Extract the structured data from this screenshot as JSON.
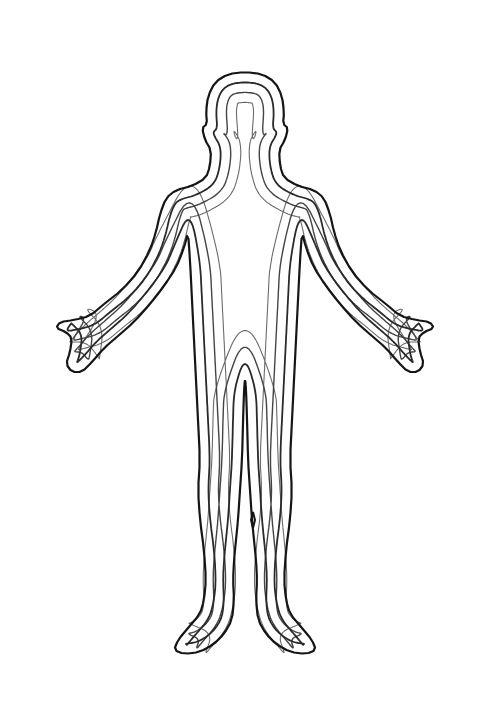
{
  "diagram": {
    "title": "Human body outline with nested contour lines",
    "background": "#ffffff",
    "contours": [
      {
        "name": "outer-contour-4",
        "offset": 30,
        "stroke": "#6a6a6a",
        "width": 1.1
      },
      {
        "name": "contour-3",
        "offset": 20,
        "stroke": "#444444",
        "width": 1.4
      },
      {
        "name": "contour-2",
        "offset": 10,
        "stroke": "#2a2a2a",
        "width": 1.8
      },
      {
        "name": "inner-body-outline",
        "offset": 0,
        "stroke": "#151515",
        "width": 2.2
      }
    ],
    "inner_leg_gap": {
      "stroke": "#151515",
      "width": 2.0
    }
  }
}
